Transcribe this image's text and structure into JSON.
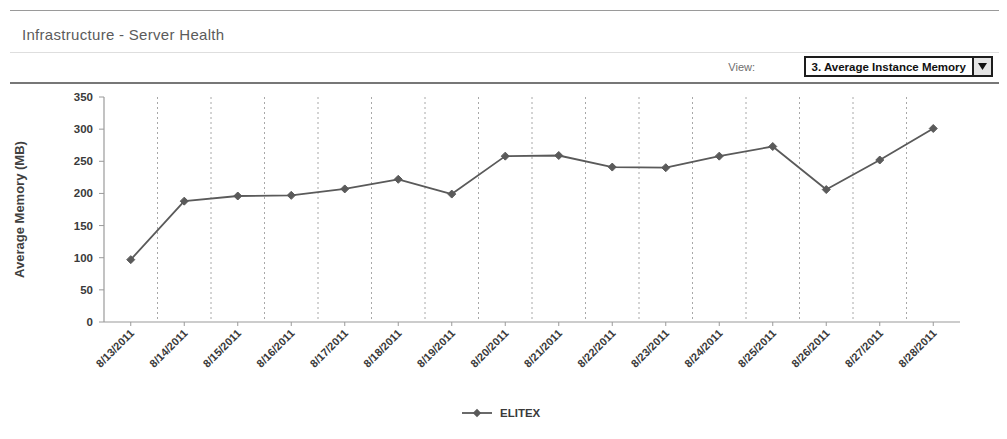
{
  "header": {
    "panel_title": "Infrastructure - Server Health",
    "view_label": "View:",
    "selected_view": "3. Average Instance Memory",
    "dropdown_icon": "chevron-down-icon"
  },
  "chart_data": {
    "type": "line",
    "title": "",
    "xlabel": "",
    "ylabel": "Average Memory (MB)",
    "ylim": [
      0,
      350
    ],
    "yticks": [
      0,
      50,
      100,
      150,
      200,
      250,
      300,
      350
    ],
    "grid": true,
    "grid_orientation": "vertical-dashed",
    "legend": [
      "ELITEX"
    ],
    "legend_position": "bottom-center",
    "marker": "diamond",
    "series_color": "#5a5a5a",
    "categories": [
      "8/13/2011",
      "8/14/2011",
      "8/15/2011",
      "8/16/2011",
      "8/17/2011",
      "8/18/2011",
      "8/19/2011",
      "8/20/2011",
      "8/21/2011",
      "8/22/2011",
      "8/23/2011",
      "8/24/2011",
      "8/25/2011",
      "8/26/2011",
      "8/27/2011",
      "8/28/2011"
    ],
    "series": [
      {
        "name": "ELITEX",
        "values": [
          97,
          188,
          196,
          197,
          207,
          222,
          199,
          258,
          259,
          241,
          240,
          258,
          273,
          206,
          252,
          301
        ]
      }
    ]
  },
  "colors": {
    "line": "#5a5a5a",
    "axis": "#9a9a9a",
    "grid": "#a8a8a8",
    "text": "#3a3a3a",
    "title": "#5b5b5b"
  }
}
